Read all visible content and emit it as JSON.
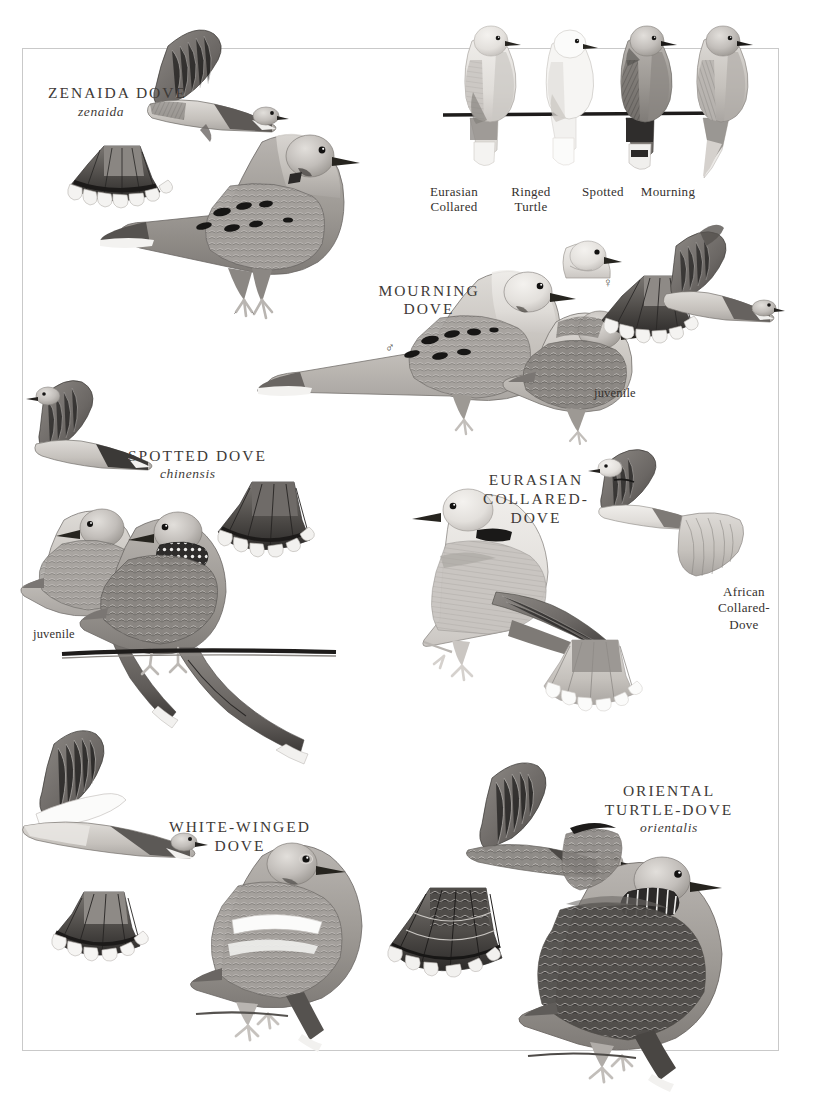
{
  "plate": {
    "title": "Dove field guide plate",
    "background_color": "#ffffff",
    "border_color": "#c9c9c9",
    "ink_color": "#3e3a37"
  },
  "species": {
    "zenaida": {
      "name": "ZENAIDA DOVE",
      "subspecies": "zenaida"
    },
    "mourning": {
      "name": "MOURNING\nDOVE",
      "juvenile": "juvenile",
      "male_symbol": "♂",
      "female_symbol": "♀"
    },
    "spotted": {
      "name": "SPOTTED DOVE",
      "subspecies": "chinensis",
      "juvenile": "juvenile"
    },
    "eurasian_collared": {
      "name": "EURASIAN\nCOLLARED-\nDOVE"
    },
    "african_collared": {
      "name": "African\nCollared-\nDove"
    },
    "white_winged": {
      "name": "WHITE-WINGED\nDOVE"
    },
    "oriental_turtle": {
      "name": "ORIENTAL\nTURTLE-DOVE",
      "subspecies": "orientalis"
    }
  },
  "perched_row": {
    "labels": [
      "Eurasian\nCollared",
      "Ringed\nTurtle",
      "Spotted",
      "Mourning"
    ]
  }
}
